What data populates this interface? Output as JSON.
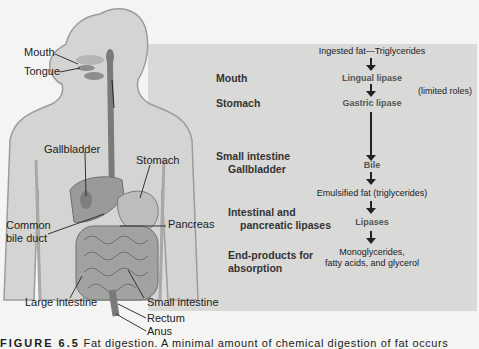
{
  "figure": {
    "anatomy_labels": {
      "mouth": "Mouth",
      "tongue": "Tongue",
      "gallbladder": "Gallbladder",
      "stomach": "Stomach",
      "common_bile_duct_1": "Common",
      "common_bile_duct_2": "bile duct",
      "pancreas": "Pancreas",
      "large_intestine": "Large intestine",
      "small_intestine": "Small intestine",
      "rectum": "Rectum",
      "anus": "Anus"
    },
    "stages": {
      "mouth": "Mouth",
      "stomach": "Stomach",
      "small_intestine": "Small intestine",
      "gallbladder": "Gallbladder",
      "lipases_1": "Intestinal and",
      "lipases_2": "pancreatic lipases",
      "end_1": "End-products for",
      "end_2": "absorption"
    },
    "flow": {
      "start": "Ingested fat—Triglycerides",
      "lingual": "Lingual lipase",
      "gastric": "Gastric lipase",
      "limited": "(limited roles)",
      "bile": "Bile",
      "emulsified": "Emulsified fat (triglycerides)",
      "lipases": "Lipases",
      "products_1": "Monoglycerides,",
      "products_2": "fatty acids, and glycerol"
    },
    "caption": {
      "label": "FIGURE 6.5",
      "text": "Fat digestion. A minimal amount of chemical digestion of fat occurs"
    }
  }
}
